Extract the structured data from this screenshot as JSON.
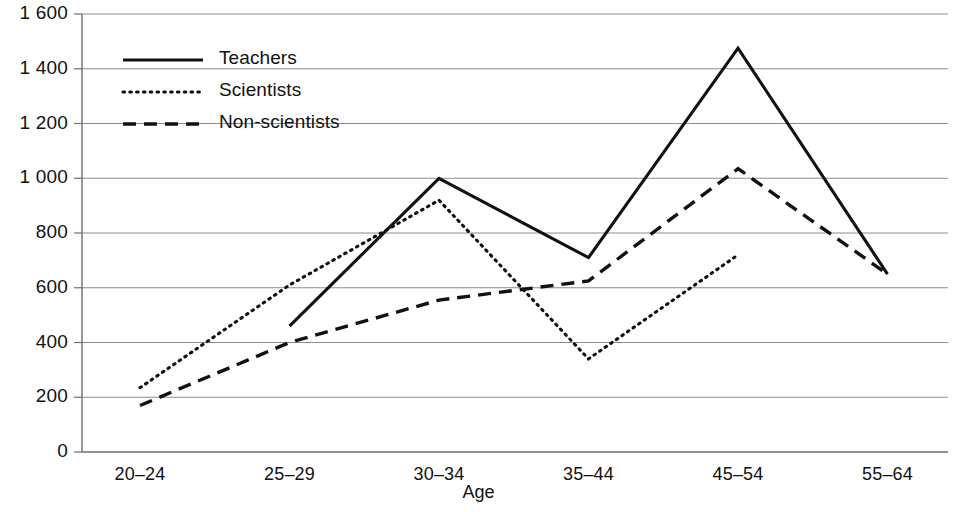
{
  "chart_data": {
    "type": "line",
    "title": "",
    "xlabel": "Age",
    "ylabel": "",
    "categories": [
      "20–24",
      "25–29",
      "30–34",
      "35–44",
      "45–54",
      "55–64"
    ],
    "ylim": [
      0,
      1600
    ],
    "ytick_values": [
      0,
      200,
      400,
      600,
      800,
      1000,
      1200,
      1400,
      1600
    ],
    "ytick_labels": [
      "0",
      "200",
      "400",
      "600",
      "800",
      "1 000",
      "1 200",
      "1 400",
      "1 600"
    ],
    "grid": true,
    "legend_position": "top-left inside plot",
    "series": [
      {
        "name": "Teachers",
        "style": "solid",
        "values": [
          null,
          460,
          1000,
          710,
          1475,
          650
        ]
      },
      {
        "name": "Scientists",
        "style": "dotted",
        "values": [
          235,
          610,
          920,
          340,
          720,
          null
        ]
      },
      {
        "name": "Non-scientists",
        "style": "dashed",
        "values": [
          170,
          400,
          555,
          625,
          1035,
          650
        ]
      }
    ]
  },
  "legend": {
    "items": [
      {
        "label": "Teachers",
        "style": "solid"
      },
      {
        "label": "Scientists",
        "style": "dotted"
      },
      {
        "label": "Non-scientists",
        "style": "dashed"
      }
    ]
  },
  "axes": {
    "x_title": "Age"
  },
  "colors": {
    "line": "#111111",
    "grid": "#8c8c8c",
    "axis": "#6e6e6e",
    "text": "#111111",
    "background": "#ffffff"
  }
}
